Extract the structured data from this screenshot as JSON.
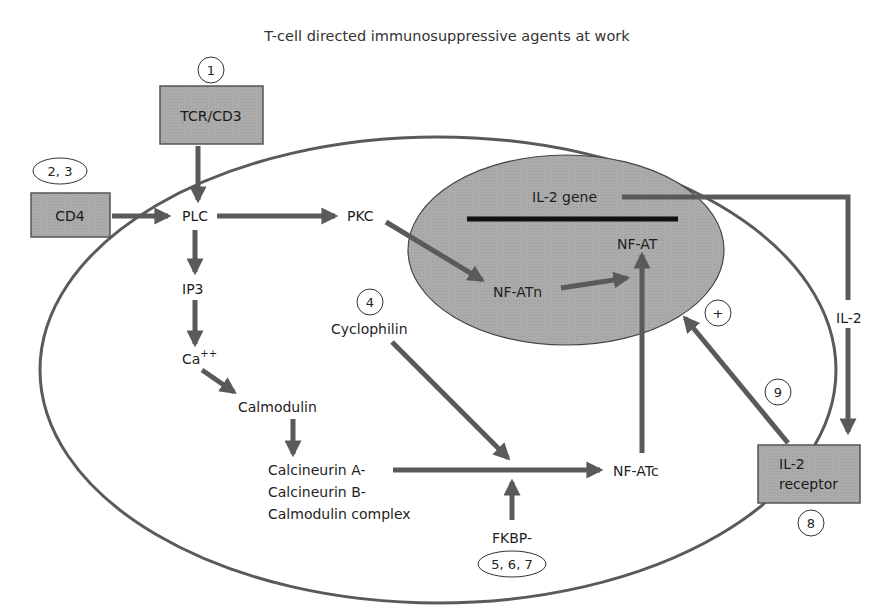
{
  "title": "T-cell directed immunosuppressive agents at work",
  "colors": {
    "arrow": "#5a5a5a",
    "cell_outline": "#5a5a5a",
    "box_fill": "#a8a8a8",
    "nucleus_fill": "#a9a9a9",
    "gene_bar": "#111111",
    "background": "#ffffff"
  },
  "boxes": {
    "tcr": "TCR/CD3",
    "cd4": "CD4",
    "il2_receptor_line1": "IL-2",
    "il2_receptor_line2": "receptor"
  },
  "markers": {
    "m1": "1",
    "m23": "2, 3",
    "m4": "4",
    "m567": "5, 6, 7",
    "m8": "8",
    "m9": "9",
    "plus": "+"
  },
  "nodes": {
    "plc": "PLC",
    "pkc": "PKC",
    "ip3": "IP3",
    "ca": "Ca",
    "ca_sup": "++",
    "calmodulin": "Calmodulin",
    "calcineurin_line1": "Calcineurin A-",
    "calcineurin_line2": "Calcineurin B-",
    "calcineurin_line3": "Calmodulin complex",
    "cyclophilin": "Cyclophilin",
    "fkbp": "FKBP-",
    "nfatc": "NF-ATc",
    "nfatn": "NF-ATn",
    "nfat": "NF-AT",
    "il2_gene": "IL-2 gene",
    "il2": "IL-2"
  }
}
